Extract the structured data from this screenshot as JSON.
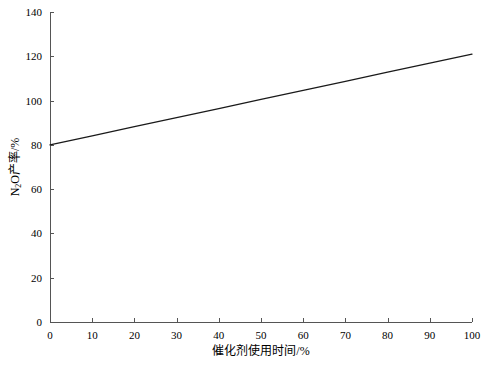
{
  "chart_data": {
    "type": "line",
    "title": "",
    "subtitle": "",
    "xlabel": "催化剂使用时间/%",
    "ylabel_prefix": "N",
    "ylabel_sub": "2",
    "ylabel_suffix": "O产率/%",
    "ylabel": "N2O产率/%",
    "xlim": [
      0,
      100
    ],
    "ylim": [
      0,
      140
    ],
    "xticks": [
      0,
      10,
      20,
      30,
      40,
      50,
      60,
      70,
      80,
      90,
      100
    ],
    "yticks": [
      0,
      20,
      40,
      60,
      80,
      100,
      120,
      140
    ],
    "xtick_labels": [
      "0",
      "10",
      "20",
      "30",
      "40",
      "50",
      "60",
      "70",
      "80",
      "90",
      "100"
    ],
    "ytick_labels": [
      "0",
      "20",
      "40",
      "60",
      "80",
      "100",
      "120",
      "140"
    ],
    "grid": false,
    "legend": null,
    "legend_position": "none",
    "tick_direction": "in",
    "axis_color": "#555555",
    "line_color": "#1a1a1a",
    "background_color": "#ffffff",
    "series": [
      {
        "name": "N2O产率",
        "color": "#1a1a1a",
        "x": [
          0,
          10,
          20,
          30,
          40,
          50,
          60,
          70,
          80,
          90,
          100
        ],
        "values": [
          80,
          84.1,
          88.2,
          92.3,
          96.4,
          100.5,
          104.6,
          108.7,
          112.8,
          116.9,
          121
        ]
      }
    ]
  },
  "geometry": {
    "plot_left": 50,
    "plot_right": 472,
    "plot_top": 12,
    "plot_bottom": 322
  }
}
